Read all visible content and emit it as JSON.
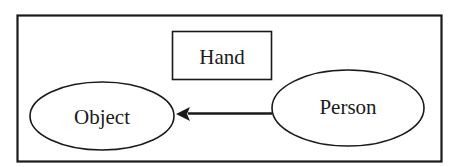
{
  "diagram": {
    "type": "entity-relation",
    "colors": {
      "stroke": "#1a1a1a",
      "background": "#ffffff",
      "text": "#1a1a1a"
    },
    "nodes": [
      {
        "id": "hand",
        "label": "Hand",
        "shape": "rectangle"
      },
      {
        "id": "object",
        "label": "Object",
        "shape": "ellipse"
      },
      {
        "id": "person",
        "label": "Person",
        "shape": "ellipse"
      }
    ],
    "edges": [
      {
        "from": "person",
        "to": "object",
        "arrow": "filled-triangle"
      }
    ]
  }
}
